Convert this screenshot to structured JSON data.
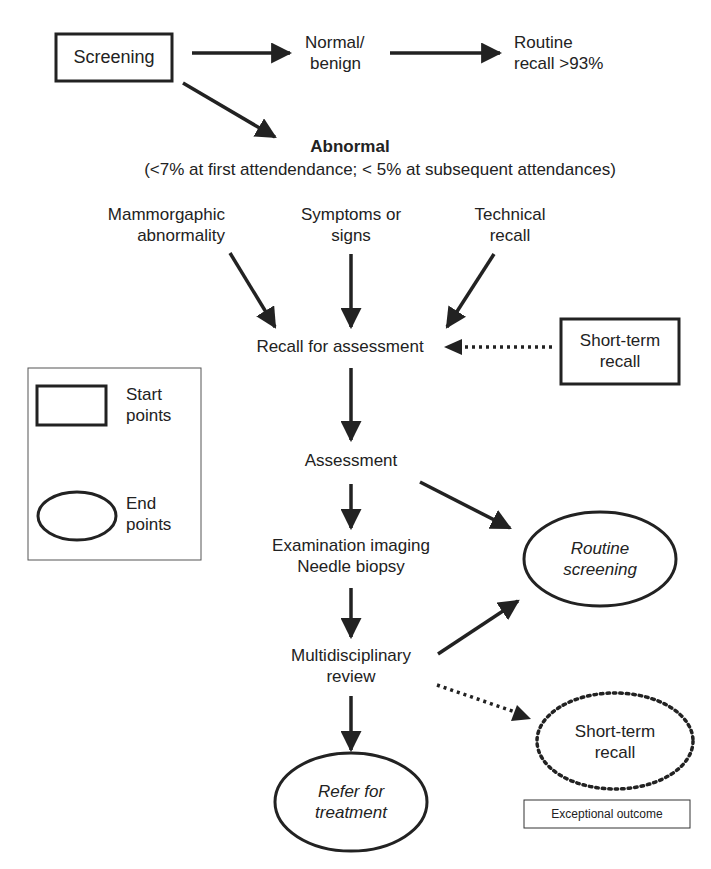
{
  "colors": {
    "ink": "#222222",
    "background": "#ffffff"
  },
  "nodes": {
    "screening": {
      "label": "Screening",
      "shape": "rectangle",
      "role": "start"
    },
    "normal_benign": {
      "lines": [
        "Normal/",
        "benign"
      ]
    },
    "routine_recall": {
      "lines": [
        "Routine",
        "recall >93%"
      ]
    },
    "abnormal": {
      "title": "Abnormal",
      "subtitle": "(<7% at first attendendance; < 5% at subsequent attendances)"
    },
    "mammographic": {
      "lines": [
        "Mammorgaphic",
        "abnormality"
      ]
    },
    "symptoms": {
      "lines": [
        "Symptoms or",
        "signs"
      ]
    },
    "technical": {
      "lines": [
        "Technical",
        "recall"
      ]
    },
    "recall_for_assessment": {
      "label": "Recall for assessment"
    },
    "short_term_recall_start": {
      "lines": [
        "Short-term",
        "recall"
      ],
      "shape": "rectangle",
      "role": "start"
    },
    "assessment": {
      "label": "Assessment"
    },
    "exam_imaging": {
      "lines": [
        "Examination imaging",
        "Needle biopsy"
      ]
    },
    "routine_screening": {
      "lines": [
        "Routine",
        "screening"
      ],
      "shape": "ellipse",
      "role": "end"
    },
    "mdt_review": {
      "lines": [
        "Multidisciplinary",
        "review"
      ]
    },
    "refer_treatment": {
      "lines": [
        "Refer for",
        "treatment"
      ],
      "shape": "ellipse",
      "role": "end"
    },
    "short_term_recall_end": {
      "lines": [
        "Short-term",
        "recall"
      ],
      "shape": "dotted-ellipse",
      "role": "end"
    },
    "exceptional_outcome": {
      "label": "Exceptional outcome"
    }
  },
  "legend": {
    "start": {
      "lines": [
        "Start",
        "points"
      ]
    },
    "end": {
      "lines": [
        "End",
        "points"
      ]
    }
  },
  "edges": [
    {
      "from": "screening",
      "to": "normal_benign",
      "style": "solid"
    },
    {
      "from": "normal_benign",
      "to": "routine_recall",
      "style": "solid"
    },
    {
      "from": "screening",
      "to": "abnormal",
      "style": "solid"
    },
    {
      "from": "mammographic",
      "to": "recall_for_assessment",
      "style": "solid"
    },
    {
      "from": "symptoms",
      "to": "recall_for_assessment",
      "style": "solid"
    },
    {
      "from": "technical",
      "to": "recall_for_assessment",
      "style": "solid"
    },
    {
      "from": "short_term_recall_start",
      "to": "recall_for_assessment",
      "style": "dotted"
    },
    {
      "from": "recall_for_assessment",
      "to": "assessment",
      "style": "solid"
    },
    {
      "from": "assessment",
      "to": "exam_imaging",
      "style": "solid"
    },
    {
      "from": "assessment",
      "to": "routine_screening",
      "style": "solid"
    },
    {
      "from": "exam_imaging",
      "to": "mdt_review",
      "style": "solid"
    },
    {
      "from": "mdt_review",
      "to": "routine_screening",
      "style": "solid"
    },
    {
      "from": "mdt_review",
      "to": "refer_treatment",
      "style": "solid"
    },
    {
      "from": "mdt_review",
      "to": "short_term_recall_end",
      "style": "dotted"
    }
  ]
}
